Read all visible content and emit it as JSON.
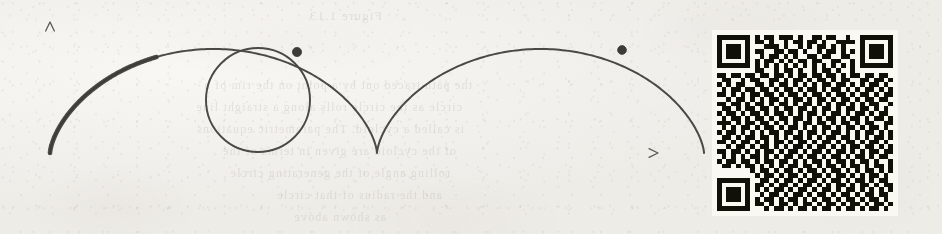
{
  "figure": {
    "kind": "cycloid-diagram",
    "ink_color": "#4a4845",
    "highlight_color": "#3d3b39",
    "axis_color": "#5a5855",
    "paper_color": "#f2f0ec",
    "line_widths": {
      "axis": 1.3,
      "curve": 2.0,
      "highlight_curve": 4.6,
      "circle": 1.9
    },
    "axes": {
      "origin": {
        "x": 50,
        "y": 153
      },
      "x_axis": {
        "x_start": 28,
        "x_end": 658,
        "y": 153,
        "arrow": true,
        "arrow_size": 7
      },
      "y_axis": {
        "x": 50,
        "y_start": 175,
        "y_end": 22,
        "arrow": true,
        "arrow_size": 7
      },
      "x_tick_spacing": 57,
      "x_tick_count": 11,
      "x_tick_length": 6,
      "y_ticks": [
        50,
        100
      ],
      "y_tick_length": 6,
      "cusp_tick": {
        "x": 393,
        "length": 11
      }
    },
    "cycloid": {
      "radius": 52,
      "baseline_y": 153,
      "start_x": 50,
      "arch_width": 327,
      "arch_count": 2,
      "highlight_param_start": 0.0,
      "highlight_param_end": 2.58,
      "sample_steps": 420
    },
    "rolling_circle": {
      "center": {
        "x": 258,
        "y": 100
      },
      "radius": 52
    },
    "points": [
      {
        "name": "tracing-point",
        "x": 297,
        "y": 52,
        "radius": 4.6
      },
      {
        "name": "end-point",
        "x": 622,
        "y": 50,
        "radius": 4.4
      }
    ]
  },
  "qr_code": {
    "name": "qr-code",
    "left": 712,
    "top": 30,
    "size": 186,
    "modules": 37,
    "quiet_zone": 1,
    "dark_color": "#17160f",
    "light_color": "#f3f1ec",
    "matrix": [
      "1111111010110111010011011001010101101",
      "1000001011010010110110100111100100001",
      "1011101000111010010101101010011101110",
      "1011101011001101101001011010110010100",
      "1011101001011010100110110011001011011",
      "1000001010110101011011001100101101001",
      "1111111010101010101010101010101011111",
      "0000000011001011010010110100110000000",
      "1101101101101101011011011010110110110",
      "0110010110011010110101101011001101101",
      "1010110011010110101010110110101011010",
      "0101101101101011010110101101010110101",
      "1101010110110101101011010110101101011",
      "0010110101011010110101101011010110110",
      "1101101011010110101101010110101011001",
      "0110101101101011011010110101101101010",
      "1011010110101101010110101101011010110",
      "0101101011010110110101011010110101101",
      "1110101101101010101101101011010110011",
      "0101011010110101101010110101101011010",
      "1011010101011011010110101101010110101",
      "0110101101101010110101011011010101101",
      "1101011010101101011010110101101011010",
      "0010110101101010110101101010110110101",
      "1101101010110101101011010110101011011",
      "0101010110101011010110101101011010110",
      "1011011010110110101011010110101101001",
      "0110101101010101101101011010110101101",
      "0000000101101011010110101101010110101",
      "1111111010110101101011010110101011010",
      "1000001001101011010110101101011010110",
      "1011101011010110101101010110101101011",
      "1011101010101101011010110101101010101",
      "1011101101011010110101101011010110110",
      "1000001010110101101010110101101011010",
      "1111111011010110101101011010110101101",
      "0000000100101101011010110101101011010"
    ]
  },
  "bleed_through": {
    "note": "faint mirrored text from reverse side of page",
    "lines": [
      {
        "text": "Figure 1.13",
        "left": 560,
        "top": 8,
        "size": 13
      },
      {
        "text": "the path traced out by a point on the rim of a",
        "left": 470,
        "top": 78,
        "size": 12
      },
      {
        "text": "circle as the circle rolls along a straight line",
        "left": 480,
        "top": 100,
        "size": 12
      },
      {
        "text": "is called a cycloid. The parametric equations",
        "left": 478,
        "top": 122,
        "size": 12
      },
      {
        "text": "of the cycloid are given in terms of the",
        "left": 486,
        "top": 144,
        "size": 12
      },
      {
        "text": "rolling angle of the generating circle",
        "left": 492,
        "top": 166,
        "size": 12
      },
      {
        "text": "and the radius of that circle",
        "left": 500,
        "top": 188,
        "size": 12
      },
      {
        "text": "as shown above",
        "left": 556,
        "top": 210,
        "size": 12
      }
    ]
  }
}
